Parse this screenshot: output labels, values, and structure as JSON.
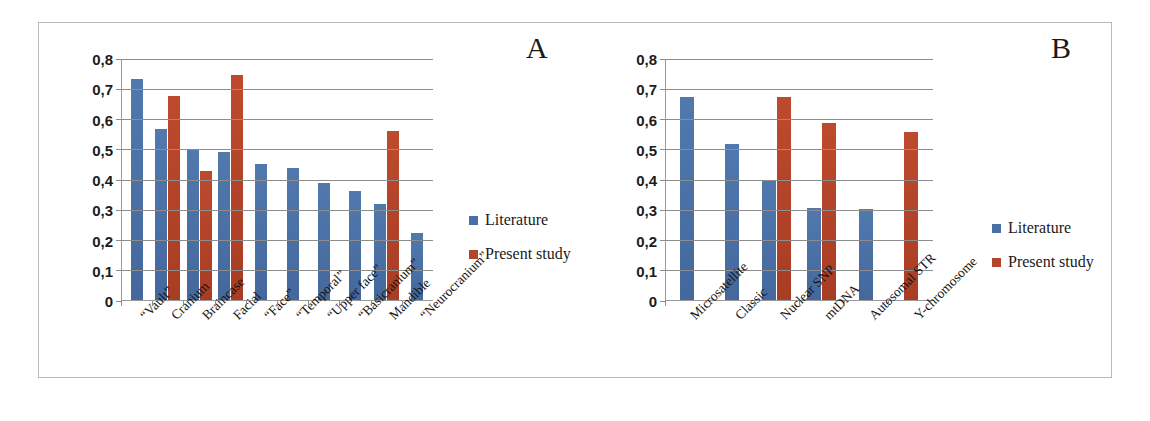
{
  "figure": {
    "panel_a_letter": "A",
    "panel_b_letter": "B"
  },
  "legend": {
    "literature": "Literature",
    "present_study": "Present study"
  },
  "colors": {
    "literature": "#4a6fa5",
    "present_study": "#b5452a",
    "gridline": "#8d8d8d",
    "frame": "#b9b9b9"
  },
  "chart_data": [
    {
      "type": "bar",
      "panel": "A",
      "title": "",
      "xlabel": "",
      "ylabel": "",
      "ylim": [
        0,
        0.8
      ],
      "ytick_labels": [
        "0",
        "0,1",
        "0,2",
        "0,3",
        "0,4",
        "0,5",
        "0,6",
        "0,7",
        "0,8"
      ],
      "ytick_values": [
        0,
        0.1,
        0.2,
        0.3,
        0.4,
        0.5,
        0.6,
        0.7,
        0.8
      ],
      "grid": true,
      "legend_position": "right",
      "categories": [
        "“Vault”",
        "Cranium",
        "Braincase",
        "Facial",
        "“Face”",
        "“Temporal”",
        "“Upper face”",
        "“Basicranium”",
        "Mandible",
        "“Neurocranium”"
      ],
      "series": [
        {
          "name": "Literature",
          "color": "#4a6fa5",
          "values": [
            0.73,
            0.565,
            0.495,
            0.49,
            0.45,
            0.437,
            0.388,
            0.362,
            0.317,
            0.222
          ]
        },
        {
          "name": "Present study",
          "color": "#b5452a",
          "values": [
            null,
            0.675,
            0.427,
            0.745,
            null,
            null,
            null,
            null,
            0.56,
            null
          ]
        }
      ]
    },
    {
      "type": "bar",
      "panel": "B",
      "title": "",
      "xlabel": "",
      "ylabel": "",
      "ylim": [
        0,
        0.8
      ],
      "ytick_labels": [
        "0",
        "0,1",
        "0,2",
        "0,3",
        "0,4",
        "0,5",
        "0,6",
        "0,7",
        "0,8"
      ],
      "ytick_values": [
        0,
        0.1,
        0.2,
        0.3,
        0.4,
        0.5,
        0.6,
        0.7,
        0.8
      ],
      "grid": true,
      "legend_position": "right",
      "categories": [
        "Microsatellite",
        "Classic",
        "Nuclear SNP",
        "mtDNA",
        "Autosomal STR",
        "Y-chromosome"
      ],
      "series": [
        {
          "name": "Literature",
          "color": "#4a6fa5",
          "values": [
            0.67,
            0.515,
            0.395,
            0.305,
            0.3,
            null
          ]
        },
        {
          "name": "Present study",
          "color": "#b5452a",
          "values": [
            null,
            null,
            0.67,
            0.585,
            null,
            0.555
          ]
        }
      ]
    }
  ]
}
